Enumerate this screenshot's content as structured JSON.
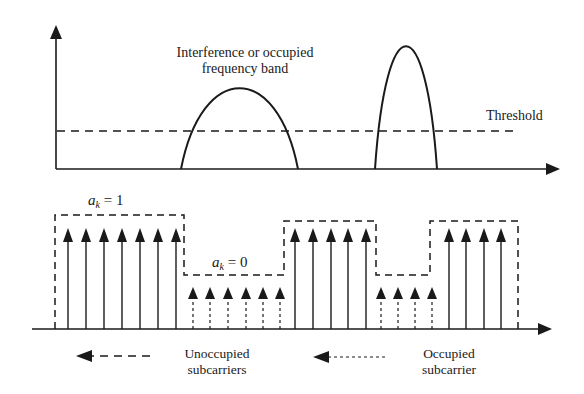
{
  "diagram": {
    "colors": {
      "stroke": "#1a1a1a",
      "background": "#ffffff"
    },
    "top_panel": {
      "y_axis": {
        "x": 56,
        "y_top": 25,
        "y_bottom": 169
      },
      "x_axis": {
        "y": 169,
        "x_start": 56,
        "x_end": 560
      },
      "threshold": {
        "y": 131,
        "x_start": 57,
        "x_end": 515,
        "label": "Threshold"
      },
      "humps": [
        {
          "name": "interference-band-1",
          "x_start": 181,
          "x_end": 298,
          "apex_x": 239,
          "apex_y": 88
        },
        {
          "name": "interference-band-2",
          "x_start": 375,
          "x_end": 437,
          "apex_x": 405,
          "apex_y": 46
        }
      ],
      "annotation": {
        "line1": "Interference or occupied",
        "line2": "frequency band"
      }
    },
    "bottom_panel": {
      "x_axis": {
        "y": 329,
        "x_start": 32,
        "x_end": 552
      },
      "unoccupied_arrows_x": [
        68,
        86,
        104,
        122,
        140,
        158,
        176,
        295,
        313,
        331,
        348,
        366,
        449,
        466,
        484,
        501
      ],
      "occupied_arrows_x": [
        193,
        210,
        228,
        246,
        263,
        280,
        381,
        398,
        415,
        432
      ],
      "tall_arrow_top": 228,
      "short_arrow_top": 287,
      "mask_envelope": {
        "high_y": 215,
        "high_y2": 221,
        "low_y": 275,
        "points": [
          [
            55,
            329
          ],
          [
            55,
            215
          ],
          [
            184,
            215
          ],
          [
            184,
            275
          ],
          [
            284,
            275
          ],
          [
            284,
            221
          ],
          [
            376,
            221
          ],
          [
            376,
            275
          ],
          [
            430,
            275
          ],
          [
            430,
            221
          ],
          [
            518,
            221
          ],
          [
            518,
            329
          ]
        ]
      },
      "labels": {
        "ak_high": {
          "var": "a",
          "sub": "k",
          "eq": " = 1"
        },
        "ak_low": {
          "var": "a",
          "sub": "k",
          "eq": " = 0"
        }
      }
    },
    "legend": {
      "unoccupied": {
        "label_line1": "Unoccupied",
        "label_line2": "subcarriers",
        "arrow_x_start": 150,
        "arrow_x_end": 76,
        "y": 356
      },
      "occupied": {
        "label_line1": "Occupied",
        "label_line2": "subcarrier",
        "arrow_x_start": 385,
        "arrow_x_end": 313,
        "y": 357
      }
    }
  }
}
